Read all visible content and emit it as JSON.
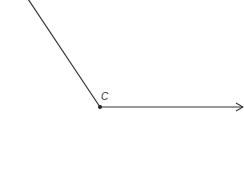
{
  "diagram": {
    "type": "angle",
    "vertex": {
      "label": "C",
      "x": 100,
      "y": 107
    },
    "ray1": {
      "from": [
        100,
        107
      ],
      "to": [
        28,
        0
      ]
    },
    "ray2": {
      "from": [
        100,
        107
      ],
      "to": [
        243,
        107
      ],
      "arrow": true
    },
    "colors": {
      "line": "#333333",
      "background": "#ffffff"
    }
  }
}
